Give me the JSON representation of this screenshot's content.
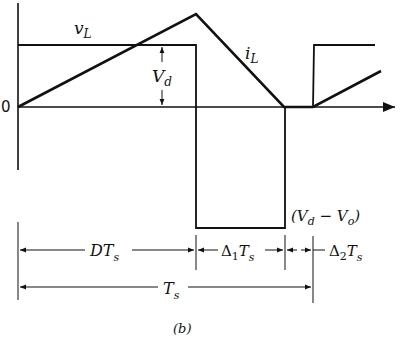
{
  "diagram": {
    "labels": {
      "vL": "v",
      "vL_sub": "L",
      "iL": "i",
      "iL_sub": "L",
      "Vd": "V",
      "Vd_sub": "d",
      "zero": "0",
      "neg_level": "(V",
      "neg_level_sub1": "d",
      "neg_level_mid": " − V",
      "neg_level_sub2": "o",
      "neg_level_end": ")",
      "DTs": "DT",
      "DTs_sub": "s",
      "d1Ts": "Δ",
      "d1Ts_sub1": "1",
      "d1Ts_T": "T",
      "d1Ts_sub2": "s",
      "d2Ts": "Δ",
      "d2Ts_sub1": "2",
      "d2Ts_T": "T",
      "d2Ts_sub2": "s",
      "Ts": "T",
      "Ts_sub": "s",
      "caption": "(b)"
    },
    "colors": {
      "stroke": "#111111",
      "background": "#ffffff"
    }
  }
}
